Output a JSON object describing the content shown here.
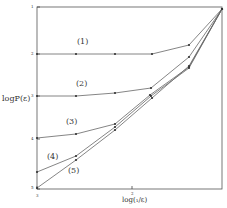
{
  "chart_data": {
    "type": "line",
    "title": "",
    "xlabel": "log(₁/ε)",
    "ylabel": "logP(ε)",
    "x_ticks": [
      {
        "label": "3",
        "px": 37
      },
      {
        "label": "2",
        "px": 132
      }
    ],
    "y_ticks": [
      {
        "label": "1",
        "py": 7
      },
      {
        "label": "2",
        "py": 54
      },
      {
        "label": "3",
        "py": 96
      },
      {
        "label": "4",
        "py": 139
      },
      {
        "label": "5",
        "py": 189
      }
    ],
    "grid": false,
    "legend": "inline curve labels",
    "series": [
      {
        "name": "(1)",
        "label_pos": [
          80,
          44
        ],
        "points": [
          [
            37,
            54
          ],
          [
            76,
            54
          ],
          [
            115,
            54
          ],
          [
            152,
            54
          ],
          [
            189,
            45
          ],
          [
            222,
            9
          ]
        ]
      },
      {
        "name": "(2)",
        "label_pos": [
          79,
          86
        ],
        "points": [
          [
            37,
            96
          ],
          [
            76,
            96
          ],
          [
            115,
            93
          ],
          [
            151,
            88
          ],
          [
            189,
            57
          ],
          [
            222,
            9
          ]
        ]
      },
      {
        "name": "(3)",
        "label_pos": [
          67,
          120
        ],
        "points": [
          [
            37,
            138
          ],
          [
            76,
            134
          ],
          [
            115,
            124
          ],
          [
            150,
            95
          ],
          [
            189,
            67
          ],
          [
            222,
            9
          ]
        ]
      },
      {
        "name": "(4)",
        "label_pos": [
          49,
          151
        ],
        "points": [
          [
            37,
            172
          ],
          [
            76,
            156
          ],
          [
            115,
            127
          ],
          [
            151,
            96
          ],
          [
            189,
            68
          ],
          [
            222,
            9
          ]
        ]
      },
      {
        "name": "(5)",
        "label_pos": [
          70,
          169
        ],
        "points": [
          [
            37,
            188
          ],
          [
            76,
            160
          ],
          [
            115,
            130
          ],
          [
            152,
            98
          ],
          [
            189,
            66
          ],
          [
            222,
            9
          ]
        ]
      }
    ],
    "frame": {
      "left": 37,
      "right": 222,
      "top": 7,
      "bottom": 189
    }
  },
  "labels": {
    "ylabel": "logP(ε)",
    "xlabel": "log(₁/ε)",
    "tick_y1": "1",
    "tick_y2": "2",
    "tick_y3": "3",
    "tick_y4": "4",
    "tick_y5": "5",
    "tick_x3": "3",
    "tick_x2": "2",
    "curve1": "(1)",
    "curve2": "(2)",
    "curve3": "(3)",
    "curve4": "(4)",
    "curve5": "(5)"
  }
}
